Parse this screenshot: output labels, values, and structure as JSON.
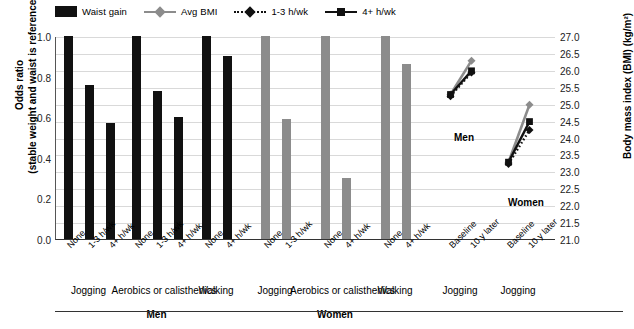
{
  "legend": {
    "items": [
      {
        "label": "Waist gain",
        "marker": "filled-square-swatch",
        "color": "#111111"
      },
      {
        "label": "Avg BMI",
        "marker": "gray-line-diamond",
        "color": "#8c8c8c"
      },
      {
        "label": "1-3 h/wk",
        "marker": "black-dotted-line-diamond",
        "color": "#111111"
      },
      {
        "label": "4+ h/wk",
        "marker": "black-solid-line-square",
        "color": "#111111"
      }
    ]
  },
  "axes": {
    "left_title_line1": "Odds ratio",
    "left_title_line2": "(stable weight and waist is reference)",
    "right_title": "Body mass index (BMI) (kg/m²)",
    "left_ticks": [
      "1.0",
      "0.8",
      "0.6",
      "0.4",
      "0.2",
      "0.0"
    ],
    "right_ticks": [
      "27.0",
      "26.5",
      "26.0",
      "25.5",
      "25.0",
      "24.5",
      "24.0",
      "23.5",
      "23.0",
      "22.5",
      "22.0",
      "21.5",
      "21.0"
    ]
  },
  "group_labels": {
    "men": "Men",
    "women": "Women"
  },
  "bmi_annotations": {
    "men": "Men",
    "women": "Women"
  },
  "x_groups": [
    {
      "name": "Jogging",
      "sex": "Men"
    },
    {
      "name": "Aerobics or calisthenics",
      "sex": "Men"
    },
    {
      "name": "Walking",
      "sex": "Men"
    },
    {
      "name": "Jogging",
      "sex": "Women"
    },
    {
      "name": "Aerobics or calisthenics",
      "sex": "Women"
    },
    {
      "name": "Walking",
      "sex": "Women"
    },
    {
      "name": "Jogging",
      "sex": "Men"
    },
    {
      "name": "Jogging",
      "sex": "Women"
    }
  ],
  "chart_data": {
    "type": "bar",
    "title": "",
    "xlabel": "",
    "ylabel": "Odds ratio (stable weight and waist is reference)",
    "y2label": "Body mass index (BMI) (kg/m²)",
    "ylim": [
      0.0,
      1.0
    ],
    "y2lim": [
      21.0,
      27.0
    ],
    "grid": true,
    "legend_position": "top-left",
    "bars": [
      {
        "sex": "Men",
        "activity": "Jogging",
        "level": "None",
        "value": 1.0,
        "color": "#111111"
      },
      {
        "sex": "Men",
        "activity": "Jogging",
        "level": "1-3 h/wk",
        "value": 0.76,
        "color": "#111111"
      },
      {
        "sex": "Men",
        "activity": "Jogging",
        "level": "4+ h/wk",
        "value": 0.57,
        "color": "#111111"
      },
      {
        "sex": "Men",
        "activity": "Aerobics or calisthenics",
        "level": "None",
        "value": 1.0,
        "color": "#111111"
      },
      {
        "sex": "Men",
        "activity": "Aerobics or calisthenics",
        "level": "1-3 h/wk",
        "value": 0.73,
        "color": "#111111"
      },
      {
        "sex": "Men",
        "activity": "Aerobics or calisthenics",
        "level": "4+ h/wk",
        "value": 0.6,
        "color": "#111111"
      },
      {
        "sex": "Men",
        "activity": "Walking",
        "level": "None",
        "value": 1.0,
        "color": "#111111"
      },
      {
        "sex": "Men",
        "activity": "Walking",
        "level": "4+ h/wk",
        "value": 0.9,
        "color": "#111111"
      },
      {
        "sex": "Women",
        "activity": "Jogging",
        "level": "None",
        "value": 1.0,
        "color": "#8c8c8c"
      },
      {
        "sex": "Women",
        "activity": "Jogging",
        "level": "1-3 h/wk",
        "value": 0.59,
        "color": "#8c8c8c"
      },
      {
        "sex": "Women",
        "activity": "Aerobics or calisthenics",
        "level": "None",
        "value": 1.0,
        "color": "#8c8c8c"
      },
      {
        "sex": "Women",
        "activity": "Aerobics or calisthenics",
        "level": "4+ h/wk",
        "value": 0.3,
        "color": "#8c8c8c"
      },
      {
        "sex": "Women",
        "activity": "Walking",
        "level": "None",
        "value": 1.0,
        "color": "#8c8c8c"
      },
      {
        "sex": "Women",
        "activity": "Walking",
        "level": "4+ h/wk",
        "value": 0.86,
        "color": "#8c8c8c"
      }
    ],
    "bmi_series": [
      {
        "sex": "Men",
        "name": "Avg BMI",
        "style": "gray-solid-diamond",
        "x": [
          "Baseline",
          "10 y later"
        ],
        "values": [
          25.3,
          26.3
        ]
      },
      {
        "sex": "Men",
        "name": "1-3 h/wk",
        "style": "black-dotted-diamond",
        "x": [
          "Baseline",
          "10 y later"
        ],
        "values": [
          25.25,
          25.95
        ]
      },
      {
        "sex": "Men",
        "name": "4+ h/wk",
        "style": "black-solid-square",
        "x": [
          "Baseline",
          "10 y later"
        ],
        "values": [
          25.3,
          26.0
        ]
      },
      {
        "sex": "Women",
        "name": "Avg BMI",
        "style": "gray-solid-diamond",
        "x": [
          "Baseline",
          "10 y later"
        ],
        "values": [
          23.3,
          25.0
        ]
      },
      {
        "sex": "Women",
        "name": "1-3 h/wk",
        "style": "black-dotted-diamond",
        "x": [
          "Baseline",
          "10 y later"
        ],
        "values": [
          23.25,
          24.25
        ]
      },
      {
        "sex": "Women",
        "name": "4+ h/wk",
        "style": "black-solid-square",
        "x": [
          "Baseline",
          "10 y later"
        ],
        "values": [
          23.3,
          24.5
        ]
      }
    ],
    "x_tick_labels": [
      "None",
      "1-3 h/wk",
      "4+ h/wk",
      "None",
      "1-3 h/wk",
      "4+ h/wk",
      "None",
      "4+ h/wk",
      "None",
      "1-3 h/wk",
      "None",
      "4+ h/wk",
      "None",
      "4+ h/wk",
      "Baseline",
      "10 y later",
      "Baseline",
      "10 y later"
    ]
  }
}
